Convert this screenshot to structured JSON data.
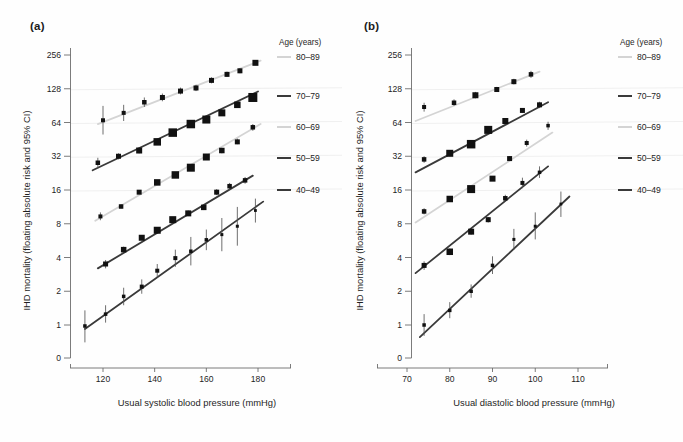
{
  "figure": {
    "background": "#fefefe",
    "dark_color": "#3a3a3a",
    "light_color": "#d4d4d4",
    "marker_color": "#111111"
  },
  "panels": [
    {
      "label": "(a)",
      "id": "panel-a"
    },
    {
      "label": "(b)",
      "id": "panel-b"
    }
  ],
  "legend": {
    "title": "Age (years)",
    "entries": [
      {
        "label": "80–89",
        "color": "#d4d4d4",
        "y": 57
      },
      {
        "label": "70–79",
        "color": "#3a3a3a",
        "y": 96
      },
      {
        "label": "60–69",
        "color": "#d4d4d4",
        "y": 127
      },
      {
        "label": "50–59",
        "color": "#3a3a3a",
        "y": 158
      },
      {
        "label": "40–49",
        "color": "#3a3a3a",
        "y": 190
      }
    ]
  },
  "chart_data": [
    {
      "type": "scatter",
      "panel": "(a)",
      "title": "IHD mortality by usual systolic blood pressure",
      "xlabel": "Usual systolic blood pressure (mmHg)",
      "ylabel": "IHD mortality (floating absolute risk and 95% CI)",
      "yscale": "log2",
      "yticks": [
        256,
        128,
        64,
        32,
        16,
        8,
        4,
        2,
        1,
        0
      ],
      "ytick_labels": [
        "256",
        "128",
        "64",
        "32",
        "16",
        "8",
        "4",
        "2",
        "1",
        "0"
      ],
      "ylim": [
        1,
        256
      ],
      "xticks": [
        120,
        140,
        160,
        180
      ],
      "xtick_labels": [
        "120",
        "140",
        "160",
        "180"
      ],
      "xlim": [
        112,
        188
      ],
      "grid": "faint horizontal reference lines",
      "legend_position": "right-outside",
      "series": [
        {
          "name": "80–89",
          "color": "#d4d4d4",
          "x": [
            120,
            128,
            136,
            143,
            150,
            156,
            162,
            168,
            173,
            179
          ],
          "y": [
            67,
            78,
            97,
            107,
            122,
            130,
            152,
            172,
            185,
            218
          ],
          "ci_low": [
            50,
            66,
            88,
            99,
            114,
            122,
            143,
            163,
            176,
            208
          ],
          "ci_high": [
            90,
            92,
            107,
            116,
            131,
            139,
            162,
            182,
            195,
            229
          ],
          "marker_sizes": [
            4,
            4,
            4.5,
            5,
            5,
            5,
            5,
            5,
            5,
            6
          ],
          "fit_line": {
            "x": [
              118,
              181
            ],
            "y": [
              62,
              228
            ]
          }
        },
        {
          "name": "70–79",
          "color": "#3a3a3a",
          "x": [
            118,
            126,
            134,
            141,
            147,
            154,
            160,
            166,
            172,
            178
          ],
          "y": [
            28,
            32,
            36,
            43,
            52,
            62,
            68,
            78,
            92,
            107
          ],
          "ci_low": [
            25,
            30,
            34,
            41,
            50,
            60,
            66,
            75,
            88,
            101
          ],
          "ci_high": [
            31,
            34,
            38,
            45,
            54,
            64,
            70,
            81,
            96,
            113
          ],
          "marker_sizes": [
            4.5,
            5,
            6,
            7.5,
            8.5,
            8.5,
            8,
            7,
            6.5,
            9
          ],
          "fit_line": {
            "x": [
              116,
              180
            ],
            "y": [
              24,
              121
            ]
          }
        },
        {
          "name": "60–69",
          "color": "#d4d4d4",
          "x": [
            119,
            127,
            134,
            141,
            148,
            154,
            160,
            166,
            172,
            178
          ],
          "y": [
            9.3,
            11.4,
            15.3,
            18.7,
            21.8,
            25.3,
            31.5,
            36,
            43,
            58
          ],
          "ci_low": [
            8.6,
            11.0,
            14.8,
            18.2,
            21.2,
            24.4,
            30.2,
            34,
            41,
            54
          ],
          "ci_high": [
            10.1,
            11.9,
            15.9,
            19.3,
            22.5,
            26.3,
            33.0,
            38,
            46,
            62
          ],
          "marker_sizes": [
            4,
            4.5,
            5,
            6.5,
            7.5,
            8,
            7,
            5.5,
            5,
            4.5
          ],
          "fit_line": {
            "x": [
              117,
              181
            ],
            "y": [
              8.5,
              62
            ]
          }
        },
        {
          "name": "50–59",
          "color": "#3a3a3a",
          "x": [
            121,
            128,
            135,
            141,
            147,
            153,
            159,
            164,
            169,
            175
          ],
          "y": [
            3.5,
            4.7,
            6.0,
            7.0,
            8.7,
            9.9,
            11.2,
            15.3,
            17.3,
            19.5
          ],
          "ci_low": [
            3.2,
            4.4,
            5.7,
            6.7,
            8.3,
            9.4,
            10.6,
            14.4,
            16.2,
            18.2
          ],
          "ci_high": [
            3.8,
            5.0,
            6.3,
            7.4,
            9.2,
            10.5,
            11.9,
            16.3,
            18.5,
            20.9
          ],
          "marker_sizes": [
            5,
            5.5,
            6,
            7,
            7,
            6,
            5.5,
            5,
            4.5,
            4.5
          ],
          "fit_line": {
            "x": [
              118,
              178
            ],
            "y": [
              3.2,
              21.5
            ]
          }
        },
        {
          "name": "40–49",
          "color": "#3a3a3a",
          "x": [
            113,
            121,
            128,
            135,
            141,
            148,
            154,
            160,
            166,
            172,
            179
          ],
          "y": [
            0.98,
            1.25,
            1.8,
            2.2,
            3.05,
            3.95,
            4.55,
            5.75,
            6.4,
            7.6,
            10.5
          ],
          "ci_low": [
            0.7,
            1.05,
            1.5,
            1.9,
            2.65,
            3.3,
            3.4,
            4.65,
            4.55,
            5.1,
            8.2
          ],
          "ci_high": [
            1.35,
            1.5,
            2.15,
            2.55,
            3.5,
            4.7,
            6.1,
            7.1,
            9.0,
            11.3,
            13.4
          ],
          "marker_sizes": [
            3.5,
            3.5,
            3.5,
            4,
            4,
            4,
            3.5,
            3.5,
            3,
            3,
            2.8
          ],
          "fit_line": {
            "x": [
              113,
              182
            ],
            "y": [
              0.92,
              12.6
            ]
          }
        }
      ]
    },
    {
      "type": "scatter",
      "panel": "(b)",
      "title": "IHD mortality by usual diastolic blood pressure",
      "xlabel": "Usual diastolic blood pressure (mmHg)",
      "ylabel": "IHD mortality (floating absolute risk and 95% CI)",
      "yscale": "log2",
      "yticks": [
        256,
        128,
        64,
        32,
        16,
        8,
        4,
        2,
        1,
        0
      ],
      "ytick_labels": [
        "256",
        "128",
        "64",
        "32",
        "16",
        "8",
        "4",
        "2",
        "1",
        "0"
      ],
      "ylim": [
        1,
        256
      ],
      "xticks": [
        70,
        80,
        90,
        100,
        110
      ],
      "xtick_labels": [
        "70",
        "80",
        "90",
        "100",
        "110"
      ],
      "xlim": [
        66,
        114
      ],
      "grid": "faint horizontal reference lines",
      "legend_position": "right-outside",
      "series": [
        {
          "name": "80–89",
          "color": "#d4d4d4",
          "x": [
            74,
            81,
            86,
            91,
            95,
            99
          ],
          "y": [
            88,
            96,
            112,
            126,
            148,
            172
          ],
          "ci_low": [
            80,
            90,
            105,
            120,
            140,
            160
          ],
          "ci_high": [
            96,
            103,
            120,
            133,
            157,
            185
          ],
          "marker_sizes": [
            4,
            4.5,
            6,
            5,
            5,
            4.5
          ],
          "fit_line": {
            "x": [
              72,
              101
            ],
            "y": [
              66,
              182
            ]
          }
        },
        {
          "name": "70–79",
          "color": "#3a3a3a",
          "x": [
            74,
            80,
            85,
            89,
            93,
            97,
            101
          ],
          "y": [
            30,
            34,
            41,
            55,
            66,
            82,
            92
          ],
          "ci_low": [
            28,
            32,
            39,
            53,
            63,
            78,
            86
          ],
          "ci_high": [
            32,
            36,
            43,
            57,
            69,
            86,
            98
          ],
          "marker_sizes": [
            4.5,
            7,
            8.5,
            8,
            6,
            5,
            5
          ],
          "fit_line": {
            "x": [
              72,
              103
            ],
            "y": [
              23,
              97
            ]
          }
        },
        {
          "name": "60–69",
          "color": "#d4d4d4",
          "x": [
            74,
            80,
            85,
            90,
            94,
            98,
            103
          ],
          "y": [
            10.3,
            13.3,
            16.3,
            20.2,
            30.5,
            42,
            60
          ],
          "ci_low": [
            9.7,
            12.7,
            15.6,
            19.3,
            29.0,
            39,
            55
          ],
          "ci_high": [
            11.0,
            14.0,
            17.1,
            21.2,
            32.1,
            45,
            65
          ],
          "marker_sizes": [
            4.5,
            6.5,
            8,
            6,
            5,
            4,
            3.5
          ],
          "fit_line": {
            "x": [
              72,
              104
            ],
            "y": [
              8.2,
              52
            ]
          }
        },
        {
          "name": "50–59",
          "color": "#3a3a3a",
          "x": [
            74,
            80,
            85,
            89,
            93,
            97,
            101
          ],
          "y": [
            3.4,
            4.5,
            6.8,
            8.7,
            13.5,
            18.5,
            23
          ],
          "ci_low": [
            3.1,
            4.2,
            6.4,
            8.2,
            12.6,
            16.6,
            20.5
          ],
          "ci_high": [
            3.7,
            4.8,
            7.2,
            9.2,
            14.5,
            20.6,
            26
          ],
          "marker_sizes": [
            5,
            6.5,
            6,
            5,
            4.5,
            4,
            3.5
          ],
          "fit_line": {
            "x": [
              72,
              103
            ],
            "y": [
              2.9,
              26
            ]
          }
        },
        {
          "name": "40–49",
          "color": "#3a3a3a",
          "x": [
            74,
            80,
            85,
            90,
            95,
            100,
            106
          ],
          "y": [
            1.0,
            1.35,
            2.0,
            3.4,
            5.8,
            7.6,
            12.0
          ],
          "ci_low": [
            0.8,
            1.15,
            1.75,
            2.85,
            4.7,
            5.8,
            9.2
          ],
          "ci_high": [
            1.25,
            1.6,
            2.3,
            4.1,
            7.2,
            10.1,
            15.5
          ],
          "marker_sizes": [
            3.5,
            3.5,
            3.5,
            3.5,
            3,
            3,
            2.8
          ],
          "fit_line": {
            "x": [
              73,
              108
            ],
            "y": [
              0.78,
              14.0
            ]
          }
        }
      ]
    }
  ]
}
